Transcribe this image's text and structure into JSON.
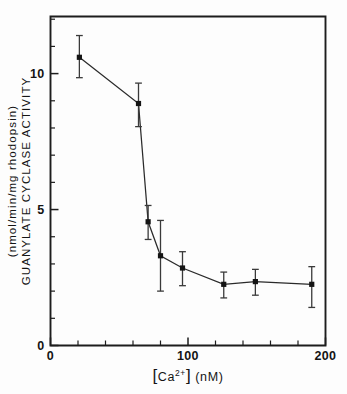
{
  "chart_data": {
    "type": "scatter",
    "title": "",
    "subtitle": "",
    "xlabel": "[Ca2+]  (nM)",
    "xlabel_base": "[Ca",
    "xlabel_sup": "2+",
    "xlabel_tail": "]   (nM)",
    "ylabel": "GUANYLATE  CYCLASE  ACTIVITY   (nmol/min/mg  rhodopsin)",
    "ylabel_line1": "GUANYLATE  CYCLASE  ACTIVITY",
    "ylabel_line2": "(nmol/min/mg  rhodopsin)",
    "xlim": [
      0,
      200
    ],
    "ylim": [
      0,
      12.1
    ],
    "grid": false,
    "legend": "none",
    "x_major_ticks": [
      0,
      100,
      200
    ],
    "x_major_tick_labels": [
      "0",
      "100",
      "200"
    ],
    "x_minor_tick_step": 20,
    "y_major_ticks": [
      0,
      5,
      10
    ],
    "y_major_tick_labels": [
      "0",
      "5",
      "10"
    ],
    "y_minor_tick_step": 1,
    "marker": "square",
    "error_bars": "asymmetric",
    "x": [
      21,
      64,
      71,
      80,
      96,
      126,
      149,
      190
    ],
    "values": [
      10.6,
      8.9,
      4.55,
      3.3,
      2.85,
      2.25,
      2.35,
      2.25
    ],
    "y_err_low": [
      0.75,
      0.85,
      0.65,
      1.3,
      0.65,
      0.5,
      0.5,
      0.85
    ],
    "y_err_high": [
      0.8,
      0.75,
      0.6,
      1.3,
      0.6,
      0.45,
      0.45,
      0.65
    ],
    "series": [
      {
        "name": "Guanylate cyclase activity",
        "points": [
          {
            "x": 21,
            "y": 10.6,
            "err_low": 0.75,
            "err_high": 0.8
          },
          {
            "x": 64,
            "y": 8.9,
            "err_low": 0.85,
            "err_high": 0.75
          },
          {
            "x": 71,
            "y": 4.55,
            "err_low": 0.65,
            "err_high": 0.6
          },
          {
            "x": 80,
            "y": 3.3,
            "err_low": 1.3,
            "err_high": 1.3
          },
          {
            "x": 96,
            "y": 2.85,
            "err_low": 0.65,
            "err_high": 0.6
          },
          {
            "x": 126,
            "y": 2.25,
            "err_low": 0.5,
            "err_high": 0.45
          },
          {
            "x": 149,
            "y": 2.35,
            "err_low": 0.5,
            "err_high": 0.45
          },
          {
            "x": 190,
            "y": 2.25,
            "err_low": 0.85,
            "err_high": 0.65
          }
        ]
      }
    ]
  },
  "colors": {
    "axis": "#1d1d1d",
    "data": "#2a2a2a",
    "marker": "#141414",
    "background": "#fdfdfd"
  }
}
